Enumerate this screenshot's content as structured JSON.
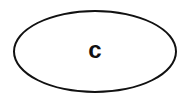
{
  "diagram": {
    "nodes": [
      {
        "id": "c",
        "shape": "ellipse",
        "label": "c"
      }
    ],
    "colors": {
      "stroke": "#111111",
      "text": "#111111",
      "background": "#ffffff"
    }
  }
}
